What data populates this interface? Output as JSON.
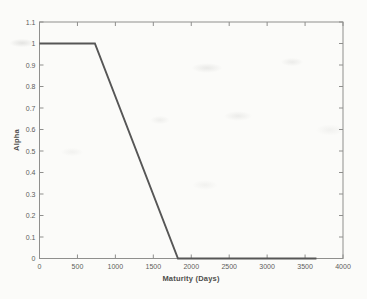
{
  "chart_data": {
    "type": "line",
    "title": "",
    "xlabel": "Maturity (Days)",
    "ylabel": "Alpha",
    "xlim": [
      0,
      4000
    ],
    "ylim": [
      0,
      1.1
    ],
    "xticks": [
      0,
      500,
      1000,
      1500,
      2000,
      2500,
      3000,
      3500,
      4000
    ],
    "xtick_labels": [
      "0",
      "500",
      "1000",
      "1500",
      "2000",
      "2500",
      "3000",
      "3500",
      "4000"
    ],
    "yticks": [
      0,
      0.1,
      0.2,
      0.3,
      0.4,
      0.5,
      0.6,
      0.7,
      0.8,
      0.9,
      1.0,
      1.1
    ],
    "ytick_labels": [
      "0",
      "0.1",
      "0.2",
      "0.3",
      "0.4",
      "0.5",
      "0.6",
      "0.7",
      "0.8",
      "0.9",
      "1",
      "1.1"
    ],
    "grid": false,
    "box": true,
    "legend": "none",
    "series": [
      {
        "name": "alpha-profile",
        "x": [
          0,
          730,
          1825,
          3650
        ],
        "y": [
          1,
          1,
          0,
          0
        ],
        "color": "#565656",
        "line_width": 1.9
      }
    ],
    "colors": {
      "axis": "#8f8f8d",
      "tick_label": "#5d5d5b",
      "axis_title": "#4e4e4c",
      "background": "#fbfbf9"
    }
  }
}
